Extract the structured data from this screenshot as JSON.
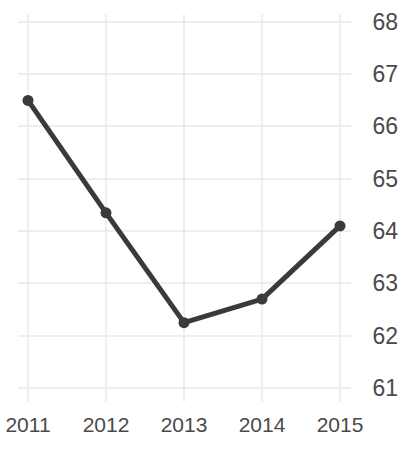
{
  "chart_data": {
    "type": "line",
    "title": "",
    "subtitle": "",
    "xlabel": "",
    "ylabel": "",
    "categories": [
      "2011",
      "2012",
      "2013",
      "2014",
      "2015"
    ],
    "x_tick_labels": [
      "2011",
      "2012",
      "2013",
      "2014",
      "2015"
    ],
    "y_tick_labels": [
      "68",
      "67",
      "66",
      "65",
      "64",
      "63",
      "62",
      "61"
    ],
    "y_ticks": [
      68,
      67,
      66,
      65,
      64,
      63,
      62,
      61
    ],
    "ylim": [
      60.5,
      68.3
    ],
    "y_axis_position": "right",
    "grid": true,
    "grid_color": "#e9e9e9",
    "legend": "none",
    "series": [
      {
        "name": "series-1",
        "color": "#3a3a3a",
        "line_width": 5,
        "marker": "circle",
        "marker_size": 11,
        "values": [
          66.5,
          64.35,
          62.25,
          62.7,
          64.1
        ]
      }
    ],
    "annotations": []
  },
  "axes": {
    "y_labels": [
      {
        "text": "68",
        "y": 22
      },
      {
        "text": "67",
        "y": 74
      },
      {
        "text": "66",
        "y": 126
      },
      {
        "text": "65",
        "y": 179
      },
      {
        "text": "64",
        "y": 231
      },
      {
        "text": "63",
        "y": 283
      },
      {
        "text": "62",
        "y": 336
      },
      {
        "text": "61",
        "y": 388
      }
    ],
    "x_labels": [
      {
        "text": "2011",
        "x": 28
      },
      {
        "text": "2012",
        "x": 106
      },
      {
        "text": "2013",
        "x": 184
      },
      {
        "text": "2014",
        "x": 262
      },
      {
        "text": "2015",
        "x": 340
      }
    ]
  }
}
